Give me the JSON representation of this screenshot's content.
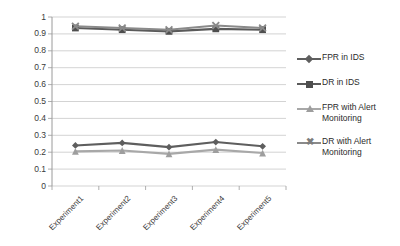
{
  "chart_data": {
    "type": "line",
    "title": "",
    "xlabel": "",
    "ylabel": "",
    "categories": [
      "Experiment1",
      "Experiment2",
      "Experiment3",
      "Experiment4",
      "Experiment5"
    ],
    "ylim": [
      0,
      1
    ],
    "ytick_labels": [
      "1",
      "0.9",
      "0.8",
      "0.7",
      "0.6",
      "0.5",
      "0.4",
      "0.3",
      "0.2",
      "0.1",
      "0"
    ],
    "ytick_values": [
      1,
      0.9,
      0.8,
      0.7,
      0.6,
      0.5,
      0.4,
      0.3,
      0.2,
      0.1,
      0
    ],
    "grid": "horizontal",
    "legend_position": "right",
    "series": [
      {
        "name": "FPR in IDS",
        "marker": "diamond",
        "color": "#5e5e5e",
        "values": [
          0.24,
          0.255,
          0.23,
          0.26,
          0.235
        ]
      },
      {
        "name": "DR in IDS",
        "marker": "square",
        "color": "#5a5a5a",
        "values": [
          0.935,
          0.925,
          0.915,
          0.93,
          0.925
        ]
      },
      {
        "name": "FPR with Alert Monitoring",
        "marker": "triangle",
        "color": "#a8a8a8",
        "values": [
          0.205,
          0.21,
          0.19,
          0.215,
          0.195
        ]
      },
      {
        "name": "DR with Alert Monitoring",
        "marker": "x",
        "color": "#8a8a8a",
        "values": [
          0.945,
          0.935,
          0.925,
          0.95,
          0.935
        ]
      }
    ]
  },
  "legend": {
    "entries": [
      {
        "label": "FPR in IDS",
        "label_line2": ""
      },
      {
        "label": "DR in IDS",
        "label_line2": ""
      },
      {
        "label": "FPR with Alert",
        "label_line2": "Monitoring"
      },
      {
        "label": "DR with Alert",
        "label_line2": "Monitoring"
      }
    ]
  },
  "colors": {
    "axis": "#9a9a9a",
    "grid": "#c8c8c8",
    "text": "#3a3a3a",
    "plot_background": "#ffffff"
  }
}
